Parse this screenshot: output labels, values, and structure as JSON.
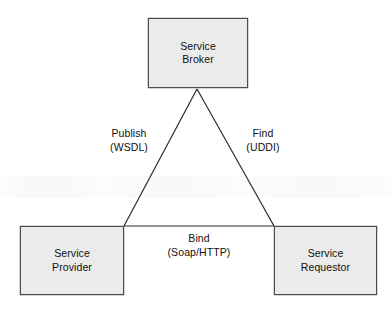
{
  "diagram": {
    "background_color": "#ffffff",
    "node_fill_color": "#ebebeb",
    "node_border_color": "#4d4d4d",
    "line_color": "#2b2b2b",
    "text_color": "#111111",
    "nodes": [
      {
        "id": "broker",
        "line1": "Service",
        "line2": "Broker",
        "position": "top-center"
      },
      {
        "id": "provider",
        "line1": "Service",
        "line2": "Provider",
        "position": "bottom-left"
      },
      {
        "id": "requestor",
        "line1": "Service",
        "line2": "Requestor",
        "position": "bottom-right"
      }
    ],
    "edges": [
      {
        "id": "publish",
        "from": "provider",
        "to": "broker",
        "line1": "Publish",
        "line2": "(WSDL)"
      },
      {
        "id": "find",
        "from": "requestor",
        "to": "broker",
        "line1": "Find",
        "line2": "(UDDI)"
      },
      {
        "id": "bind",
        "from": "provider",
        "to": "requestor",
        "line1": "Bind",
        "line2": "(Soap/HTTP)"
      }
    ]
  }
}
